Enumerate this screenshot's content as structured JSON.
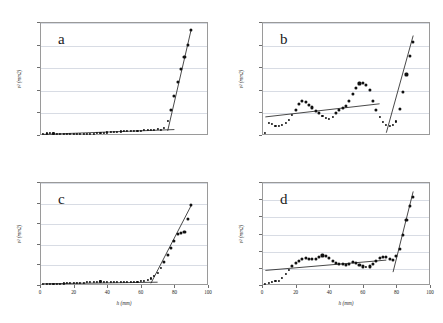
{
  "figure": {
    "panel_count": 4,
    "marker_color": "#111111",
    "fit_line_color": "#1a1a1a",
    "grid_color": "#d8dce4",
    "frame_color": "#9a9a9a"
  },
  "chart_data": [
    {
      "type": "scatter",
      "title": "a",
      "panel_label": "a",
      "xlabel": "h (mm)",
      "ylabel": "v² (mm2)",
      "xlim": [
        0,
        100
      ],
      "ylim": [
        0,
        0.15
      ],
      "xticks": [],
      "xticklabels": [],
      "yticks": [
        0,
        0.03,
        0.06,
        0.09,
        0.12,
        0.15
      ],
      "yticklabels": [
        "0.00",
        "0.03",
        "0.06",
        "0.09",
        "0.12",
        "0.15"
      ],
      "grid": true,
      "legend": "none",
      "x": [
        2,
        4,
        6,
        8,
        10,
        12,
        14,
        16,
        18,
        20,
        22,
        24,
        26,
        28,
        30,
        32,
        34,
        36,
        38,
        40,
        42,
        44,
        46,
        48,
        50,
        52,
        54,
        56,
        58,
        60,
        62,
        64,
        66,
        68,
        70,
        72,
        74,
        76,
        78,
        80,
        82,
        84,
        86,
        88,
        90
      ],
      "values": [
        0.0018,
        0.002,
        0.0022,
        0.0021,
        0.0019,
        0.0018,
        0.0016,
        0.0015,
        0.0014,
        0.0013,
        0.0012,
        0.0012,
        0.0013,
        0.0014,
        0.0016,
        0.0019,
        0.0022,
        0.0026,
        0.003,
        0.0034,
        0.0038,
        0.0041,
        0.0044,
        0.0047,
        0.0049,
        0.0051,
        0.0053,
        0.0055,
        0.0057,
        0.0059,
        0.0062,
        0.0065,
        0.0068,
        0.0072,
        0.0076,
        0.007,
        0.009,
        0.019,
        0.033,
        0.052,
        0.07,
        0.088,
        0.104,
        0.119,
        0.139
      ],
      "fit_lines": [
        {
          "name": "baseline-fit",
          "x1": 2,
          "y1": 0.0008,
          "x2": 80,
          "y2": 0.0072
        },
        {
          "name": "steep-fit",
          "x1": 76,
          "y1": 0.0055,
          "x2": 90,
          "y2": 0.14
        }
      ]
    },
    {
      "type": "scatter",
      "title": "b",
      "panel_label": "b",
      "xlabel": "h (mm)",
      "ylabel": "v² (mm2)",
      "xlim": [
        0,
        100
      ],
      "ylim": [
        0,
        0.05
      ],
      "xticks": [],
      "xticklabels": [],
      "yticks": [
        0,
        0.01,
        0.02,
        0.03,
        0.04,
        0.05
      ],
      "yticklabels": [
        "0.00",
        "0.01",
        "0.02",
        "0.03",
        "0.04",
        "0.05"
      ],
      "grid": true,
      "legend": "none",
      "x": [
        2,
        4,
        6,
        8,
        10,
        12,
        14,
        16,
        18,
        20,
        22,
        24,
        26,
        28,
        30,
        32,
        34,
        36,
        38,
        40,
        42,
        44,
        46,
        48,
        50,
        52,
        54,
        56,
        58,
        60,
        62,
        64,
        66,
        68,
        70,
        72,
        74,
        76,
        78,
        80,
        82,
        84,
        86,
        88,
        90
      ],
      "values": [
        0.001,
        0.0055,
        0.0048,
        0.0042,
        0.004,
        0.0043,
        0.0052,
        0.0068,
        0.0088,
        0.0112,
        0.0136,
        0.015,
        0.0146,
        0.0134,
        0.0122,
        0.0108,
        0.0096,
        0.0085,
        0.0076,
        0.0073,
        0.008,
        0.0097,
        0.011,
        0.0118,
        0.0128,
        0.015,
        0.018,
        0.021,
        0.0228,
        0.0232,
        0.0222,
        0.0198,
        0.0152,
        0.011,
        0.008,
        0.0058,
        0.0046,
        0.0042,
        0.0045,
        0.006,
        0.0115,
        0.019,
        0.0268,
        0.0348,
        0.041
      ],
      "fit_lines": [
        {
          "name": "baseline-fit",
          "x1": 2,
          "y1": 0.008,
          "x2": 70,
          "y2": 0.0138
        },
        {
          "name": "steep-fit",
          "x1": 74,
          "y1": 0.001,
          "x2": 90,
          "y2": 0.044
        }
      ]
    },
    {
      "type": "scatter",
      "title": "c",
      "panel_label": "c",
      "xlabel": "h (mm)",
      "ylabel": "v² (mm2)",
      "xlim": [
        0,
        100
      ],
      "ylim": [
        0,
        0.25
      ],
      "xticks": [
        0,
        20,
        40,
        60,
        80,
        100
      ],
      "xticklabels": [
        "0",
        "20",
        "40",
        "60",
        "80",
        "100"
      ],
      "yticks": [
        0,
        0.05,
        0.1,
        0.15,
        0.2,
        0.25
      ],
      "yticklabels": [
        "0.00",
        "0.05",
        "0.10",
        "0.15",
        "0.20",
        "0.25"
      ],
      "grid": true,
      "legend": "none",
      "x": [
        2,
        4,
        6,
        8,
        10,
        12,
        14,
        16,
        18,
        20,
        22,
        24,
        26,
        28,
        30,
        32,
        34,
        36,
        38,
        40,
        42,
        44,
        46,
        48,
        50,
        52,
        54,
        56,
        58,
        60,
        62,
        64,
        66,
        68,
        70,
        72,
        74,
        76,
        78,
        80,
        82,
        84,
        86,
        88,
        90
      ],
      "values": [
        0.0022,
        0.0026,
        0.003,
        0.0032,
        0.0034,
        0.0036,
        0.0038,
        0.004,
        0.0042,
        0.0044,
        0.0048,
        0.0052,
        0.0058,
        0.0064,
        0.007,
        0.0076,
        0.0082,
        0.0086,
        0.0084,
        0.008,
        0.0076,
        0.0074,
        0.0076,
        0.008,
        0.0082,
        0.008,
        0.0078,
        0.0078,
        0.0082,
        0.009,
        0.0104,
        0.0126,
        0.016,
        0.021,
        0.03,
        0.042,
        0.056,
        0.072,
        0.09,
        0.106,
        0.123,
        0.127,
        0.129,
        0.16,
        0.195
      ],
      "fit_lines": [
        {
          "name": "baseline-fit",
          "x1": 2,
          "y1": 0.003,
          "x2": 70,
          "y2": 0.0068
        },
        {
          "name": "steep-fit",
          "x1": 66,
          "y1": 0.004,
          "x2": 90,
          "y2": 0.193
        }
      ]
    },
    {
      "type": "scatter",
      "title": "d",
      "panel_label": "d",
      "xlabel": "h (mm)",
      "ylabel": "v² (mm2)",
      "xlim": [
        0,
        100
      ],
      "ylim": [
        0,
        0.06
      ],
      "xticks": [
        0,
        20,
        40,
        60,
        80,
        100
      ],
      "xticklabels": [
        "0",
        "20",
        "40",
        "60",
        "80",
        "100"
      ],
      "yticks": [
        0,
        0.01,
        0.02,
        0.03,
        0.04,
        0.05,
        0.06
      ],
      "yticklabels": [
        "0.00",
        "0.01",
        "0.02",
        "0.03",
        "0.04",
        "0.05",
        "0.06"
      ],
      "grid": true,
      "legend": "none",
      "x": [
        2,
        4,
        6,
        8,
        10,
        12,
        14,
        16,
        18,
        20,
        22,
        24,
        26,
        28,
        30,
        32,
        34,
        36,
        38,
        40,
        42,
        44,
        46,
        48,
        50,
        52,
        54,
        56,
        58,
        60,
        62,
        64,
        66,
        68,
        70,
        72,
        74,
        76,
        78,
        80,
        82,
        84,
        86,
        88,
        90
      ],
      "values": [
        0.0005,
        0.0012,
        0.0018,
        0.0022,
        0.0026,
        0.004,
        0.0062,
        0.009,
        0.0112,
        0.0128,
        0.0142,
        0.0152,
        0.0156,
        0.0154,
        0.015,
        0.0152,
        0.0162,
        0.0172,
        0.0168,
        0.0155,
        0.014,
        0.013,
        0.0124,
        0.012,
        0.0118,
        0.0124,
        0.0134,
        0.013,
        0.0118,
        0.0108,
        0.0104,
        0.0108,
        0.0122,
        0.014,
        0.0158,
        0.0166,
        0.0164,
        0.0152,
        0.0148,
        0.0168,
        0.021,
        0.029,
        0.038,
        0.046,
        0.0512
      ],
      "fit_lines": [
        {
          "name": "baseline-fit",
          "x1": 2,
          "y1": 0.0085,
          "x2": 74,
          "y2": 0.0145
        },
        {
          "name": "steep-fit",
          "x1": 78,
          "y1": 0.0075,
          "x2": 90,
          "y2": 0.0545
        }
      ]
    }
  ]
}
